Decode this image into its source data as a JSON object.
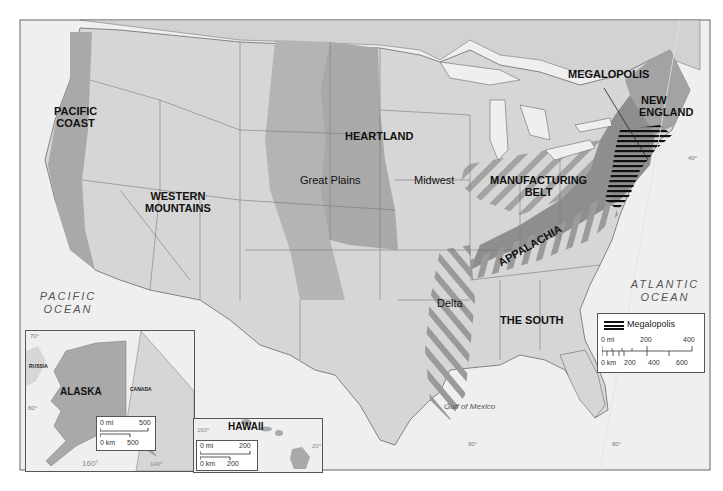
{
  "map": {
    "title": "Regions of the United States",
    "regions": [
      {
        "id": "pacific_coast",
        "label_line1": "PACIFIC",
        "label_line2": "COAST"
      },
      {
        "id": "western_mountains",
        "label_line1": "WESTERN",
        "label_line2": "MOUNTAINS"
      },
      {
        "id": "heartland",
        "label": "HEARTLAND"
      },
      {
        "id": "great_plains",
        "label": "Great Plains"
      },
      {
        "id": "midwest",
        "label": "Midwest"
      },
      {
        "id": "manufacturing_belt",
        "label_line1": "MANUFACTURING",
        "label_line2": "BELT"
      },
      {
        "id": "megalopolis",
        "label": "MEGALOPOLIS"
      },
      {
        "id": "new_england",
        "label_line1": "NEW",
        "label_line2": "ENGLAND"
      },
      {
        "id": "appalachia",
        "label": "APPALACHIA"
      },
      {
        "id": "delta",
        "label": "Delta"
      },
      {
        "id": "the_south",
        "label": "THE SOUTH"
      }
    ],
    "water_bodies": {
      "pacific": {
        "line1": "PACIFIC",
        "line2": "OCEAN"
      },
      "atlantic": {
        "line1": "ATLANTIC",
        "line2": "OCEAN"
      },
      "gulf": "Gulf of Mexico"
    },
    "graticule": {
      "lat_40": "40°",
      "lon_90": "90°",
      "lon_80": "80°"
    },
    "colors": {
      "land": "#d6d6d6",
      "region_dark": "#a9a9a9",
      "appalachia": "#8e8e8e",
      "water": "#efefef",
      "border": "#6a6a6a",
      "megalopolis_hatch": "#111111"
    }
  },
  "legend": {
    "symbol_label": "Megalopolis",
    "scale_mi": {
      "start": "0 mi",
      "mid": "200",
      "end": "400"
    },
    "scale_km": {
      "start": "0 km",
      "v1": "200",
      "v2": "400",
      "v3": "600"
    }
  },
  "inset_alaska": {
    "title": "ALASKA",
    "neighbors": {
      "russia": "RUSSIA",
      "canada": "CANADA"
    },
    "lat_70": "70°",
    "lat_60": "60°",
    "lon_160": "160°",
    "lon_140": "140°",
    "scale_mi": {
      "start": "0 mi",
      "end": "500"
    },
    "scale_km": {
      "start": "0 km",
      "end": "500"
    }
  },
  "inset_hawaii": {
    "title": "HAWAII",
    "lon_160": "160°",
    "lat_20": "20°",
    "scale_mi": {
      "start": "0 mi",
      "end": "200"
    },
    "scale_km": {
      "start": "0 km",
      "end": "200"
    }
  }
}
